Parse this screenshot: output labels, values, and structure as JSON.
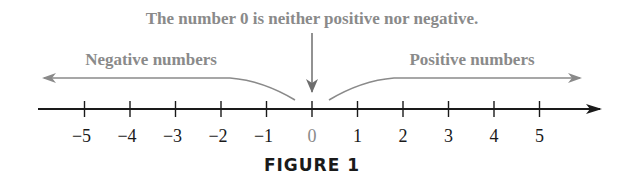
{
  "caption": "FIGURE 1",
  "annotations": {
    "zero_note": "The number 0 is neither positive nor negative.",
    "negative_label": "Negative numbers",
    "positive_label": "Positive numbers"
  },
  "number_line": {
    "ticks": [
      "−5",
      "−4",
      "−3",
      "−2",
      "−1",
      "0",
      "1",
      "2",
      "3",
      "4",
      "5"
    ],
    "values": [
      -5,
      -4,
      -3,
      -2,
      -1,
      0,
      1,
      2,
      3,
      4,
      5
    ]
  },
  "colors": {
    "axis": "#1a1a1a",
    "annotation": "#8a8a8a",
    "caption": "#1a1a1a"
  }
}
